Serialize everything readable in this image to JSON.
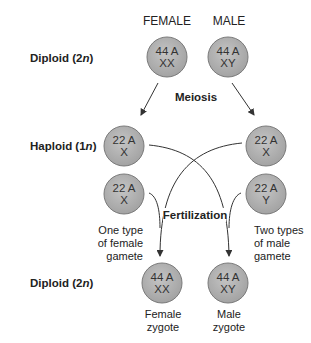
{
  "columns": {
    "female": "FEMALE",
    "male": "MALE"
  },
  "rows": {
    "diploid_top": {
      "label": "Diploid (2",
      "italic": "n",
      "close": ")"
    },
    "haploid": {
      "label": "Haploid (1",
      "italic": "n",
      "close": ")"
    },
    "diploid_bottom": {
      "label": "Diploid (2",
      "italic": "n",
      "close": ")"
    }
  },
  "processes": {
    "meiosis": "Meiosis",
    "fertilization": "Fertilization"
  },
  "cells": {
    "female_parent": {
      "line1": "44 A",
      "line2": "XX"
    },
    "male_parent": {
      "line1": "44 A",
      "line2": "XY"
    },
    "female_gamete_1": {
      "line1": "22 A",
      "line2": "X"
    },
    "female_gamete_2": {
      "line1": "22 A",
      "line2": "X"
    },
    "male_gamete_x": {
      "line1": "22 A",
      "line2": "X"
    },
    "male_gamete_y": {
      "line1": "22 A",
      "line2": "Y"
    },
    "female_zygote": {
      "line1": "44 A",
      "line2": "XX"
    },
    "male_zygote": {
      "line1": "44 A",
      "line2": "XY"
    }
  },
  "notes": {
    "female_gamete": [
      "One type",
      "of female",
      "gamete"
    ],
    "male_gamete": [
      "Two types",
      "of male",
      "gamete"
    ],
    "female_zygote": [
      "Female",
      "zygote"
    ],
    "male_zygote": [
      "Male",
      "zygote"
    ]
  },
  "colors": {
    "cell_fill": "#b0b0b0",
    "cell_stroke": "#7a7a7a",
    "line": "#333333"
  }
}
